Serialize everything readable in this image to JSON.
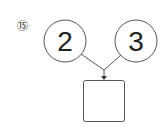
{
  "problem": {
    "number_label": "⑮",
    "inputs": [
      {
        "value": "2"
      },
      {
        "value": "3"
      }
    ],
    "output": {
      "value": ""
    }
  },
  "colors": {
    "stroke": "#555555",
    "text": "#222222",
    "number": "#888888"
  }
}
